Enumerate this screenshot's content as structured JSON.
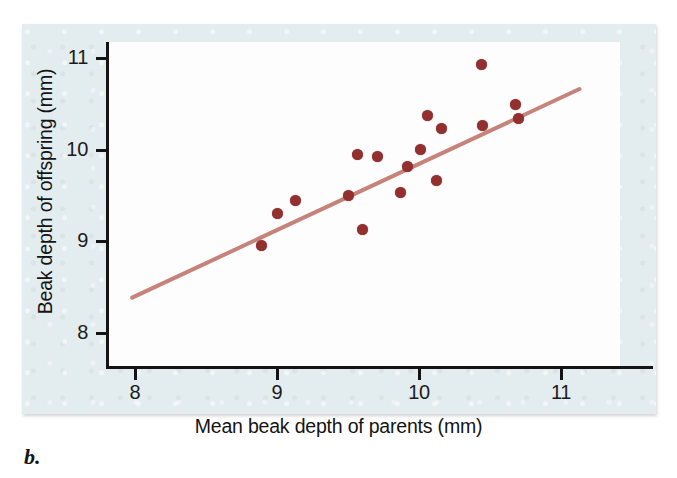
{
  "figure": {
    "caption": "b.",
    "panel_bg": "#e3ecef",
    "plot_bg": "#fdfdfd",
    "axis_color": "#141414",
    "point_color": "#93302f",
    "line_color": "#c5837a"
  },
  "chart_data": {
    "type": "scatter",
    "title": "",
    "xlabel": "Mean beak depth of parents (mm)",
    "ylabel": "Beak depth of offspring (mm)",
    "xlim": [
      7.8,
      11.4
    ],
    "ylim": [
      7.6,
      11.25
    ],
    "xticks": [
      8,
      9,
      10,
      11
    ],
    "xtick_labels": [
      "8",
      "9",
      "10",
      "11"
    ],
    "yticks": [
      8,
      9,
      10,
      11
    ],
    "ytick_labels": [
      "8",
      "9",
      "10",
      "11"
    ],
    "grid": false,
    "legend": null,
    "points": [
      {
        "x": 8.89,
        "y": 8.94
      },
      {
        "x": 9.0,
        "y": 9.29
      },
      {
        "x": 9.13,
        "y": 9.43
      },
      {
        "x": 9.5,
        "y": 9.49
      },
      {
        "x": 9.57,
        "y": 9.93
      },
      {
        "x": 9.6,
        "y": 9.12
      },
      {
        "x": 9.71,
        "y": 9.91
      },
      {
        "x": 9.87,
        "y": 9.52
      },
      {
        "x": 9.92,
        "y": 9.8
      },
      {
        "x": 10.01,
        "y": 9.99
      },
      {
        "x": 10.06,
        "y": 10.36
      },
      {
        "x": 10.12,
        "y": 9.65
      },
      {
        "x": 10.16,
        "y": 10.22
      },
      {
        "x": 10.44,
        "y": 10.92
      },
      {
        "x": 10.45,
        "y": 10.25
      },
      {
        "x": 10.68,
        "y": 10.48
      },
      {
        "x": 10.7,
        "y": 10.33
      }
    ],
    "fit_line": {
      "type": "linear-regression",
      "x_start": 7.98,
      "y_start": 8.37,
      "x_end": 11.13,
      "y_end": 10.65
    }
  },
  "axes": {
    "y_tick_0": "8",
    "y_tick_1": "9",
    "y_tick_2": "10",
    "y_tick_3": "11",
    "x_tick_0": "8",
    "x_tick_1": "9",
    "x_tick_2": "10",
    "x_tick_3": "11"
  }
}
